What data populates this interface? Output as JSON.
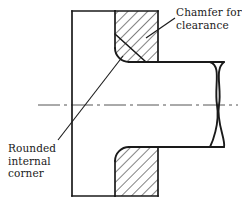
{
  "figure": {
    "type": "engineering-section-drawing",
    "width": 242,
    "height": 207,
    "background_color": "#ffffff",
    "line_color": "#1a1a1a"
  },
  "annotations": {
    "chamfer": {
      "line1": "Chamfer for",
      "line2": "clearance",
      "leader_from_x": 175,
      "leader_from_y": 18,
      "leader_to_x": 146,
      "leader_to_y": 38
    },
    "corner": {
      "line1": "Rounded",
      "line2": "internal",
      "line3": "corner",
      "leader_from_x": 58,
      "leader_from_y": 140,
      "leader_to_x": 123,
      "leader_to_y": 56
    }
  },
  "geometry": {
    "plate": {
      "left_x": 72,
      "right_x": 158,
      "top_y": 11,
      "bottom_y": 196,
      "section_split_x": 115
    },
    "shaft": {
      "top_y": 62,
      "bottom_y": 147,
      "start_x": 115,
      "break_x": 218,
      "end_x": 238
    },
    "centerline": {
      "y": 105,
      "start_x": 38,
      "end_x": 238,
      "style": "dash-dot"
    },
    "hatching": {
      "angle_deg": 45,
      "spacing_px": 7,
      "color": "#1a1a1a"
    },
    "fillet_radius": 14,
    "chamfer_present": true
  }
}
